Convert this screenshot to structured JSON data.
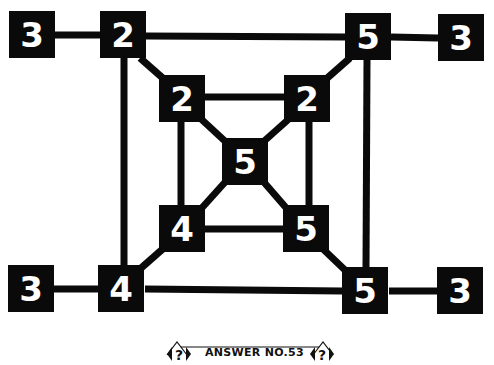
{
  "puzzle": {
    "nodes": {
      "outer_left_top": "3",
      "outer_tl": "2",
      "outer_tr": "5",
      "outer_right_top": "3",
      "inner_tl": "2",
      "inner_tr": "2",
      "center": "5",
      "inner_bl": "4",
      "inner_br": "5",
      "outer_left_bottom": "3",
      "outer_bl": "4",
      "outer_br": "5",
      "outer_right_bottom": "3"
    },
    "colors": {
      "box": "#0a0a0a",
      "digit": "#ffffff",
      "line": "#0a0a0a"
    }
  },
  "footer": {
    "label": "ANSWER NO.53",
    "left_icon": "question-mark-icon",
    "right_icon": "question-mark-icon"
  }
}
